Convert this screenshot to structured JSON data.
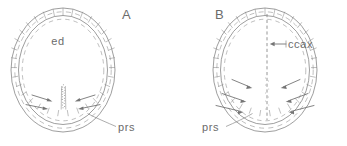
{
  "figure": {
    "type": "scientific-line-drawing",
    "background_color": "#ffffff",
    "ink_color": "#7d7d7d",
    "text_color": "#6b6b6b"
  },
  "panels": [
    {
      "id": "A",
      "letter": "A",
      "letter_x": 122,
      "letter_y": 19,
      "center_x": 63,
      "center_y": 70,
      "radius_x": 52,
      "radius_y": 62,
      "labels": [
        {
          "name": "ed",
          "text": "ed",
          "x": 58,
          "y": 45,
          "anchor": "middle"
        },
        {
          "name": "prs",
          "text": "prs",
          "x": 118,
          "y": 131,
          "anchor": "start"
        }
      ],
      "leader": {
        "from_x": 116,
        "from_y": 127,
        "to_x": 88,
        "to_y": 114
      },
      "center_feature": "stippled vertical column rising from base",
      "arrows": [
        {
          "x1": 32,
          "y1": 95,
          "x2": 52,
          "y2": 101
        },
        {
          "x1": 26,
          "y1": 105,
          "x2": 48,
          "y2": 109
        },
        {
          "x1": 95,
          "y1": 95,
          "x2": 75,
          "y2": 101
        },
        {
          "x1": 100,
          "y1": 105,
          "x2": 78,
          "y2": 109
        }
      ]
    },
    {
      "id": "B",
      "letter": "B",
      "letter_x": 215,
      "letter_y": 19,
      "center_x": 265,
      "center_y": 70,
      "radius_x": 52,
      "radius_y": 62,
      "labels": [
        {
          "name": "ccax",
          "text": "ccax",
          "x": 288,
          "y": 48,
          "anchor": "start"
        },
        {
          "name": "prs",
          "text": "prs",
          "x": 202,
          "y": 131,
          "anchor": "start"
        }
      ],
      "leader": {
        "from_x": 226,
        "from_y": 127,
        "to_x": 252,
        "to_y": 114
      },
      "axis": {
        "x": 267,
        "y_top": 14,
        "y_bottom": 120,
        "style": "dashed-vertical"
      },
      "axis_pointer": {
        "x1": 285,
        "y1": 44,
        "x2": 272,
        "y2": 44
      },
      "arrows": [
        {
          "x1": 232,
          "y1": 80,
          "x2": 252,
          "y2": 88
        },
        {
          "x1": 222,
          "y1": 94,
          "x2": 246,
          "y2": 102
        },
        {
          "x1": 216,
          "y1": 106,
          "x2": 243,
          "y2": 112
        },
        {
          "x1": 300,
          "y1": 80,
          "x2": 281,
          "y2": 88
        },
        {
          "x1": 308,
          "y1": 94,
          "x2": 286,
          "y2": 102
        },
        {
          "x1": 314,
          "y1": 106,
          "x2": 289,
          "y2": 112
        }
      ]
    }
  ],
  "legend_keys": {
    "ed": "ed",
    "prs": "prs",
    "ccax": "ccax",
    "panel_a": "A",
    "panel_b": "B"
  }
}
